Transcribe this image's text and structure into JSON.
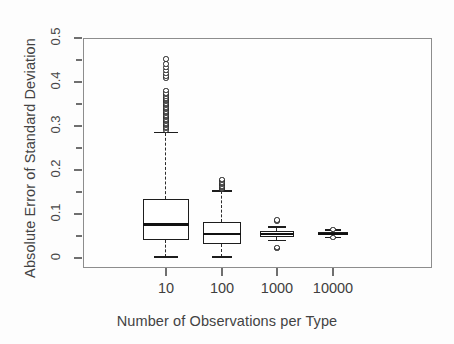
{
  "chart_data": {
    "type": "box",
    "title": "",
    "xlabel": "Number of Observations per Type",
    "ylabel": "Absolute Error of Standard Deviation",
    "categories": [
      "10",
      "100",
      "1000",
      "10000"
    ],
    "ylim": [
      0,
      0.5
    ],
    "yticks": [
      0,
      0.1,
      0.2,
      0.3,
      0.4,
      0.5
    ],
    "ytick_labels": [
      "0",
      "0.1",
      "0.2",
      "0.3",
      "0.4",
      "0.5"
    ],
    "yminor_ticks": [
      0.05,
      0.15,
      0.25,
      0.35,
      0.45
    ],
    "grid": false,
    "legend": false,
    "boxes": [
      {
        "category": "10",
        "whisker_low": 0.002,
        "q1": 0.04,
        "median": 0.076,
        "q3": 0.133,
        "whisker_high": 0.285,
        "outliers": [
          0.29,
          0.294,
          0.298,
          0.301,
          0.304,
          0.307,
          0.31,
          0.313,
          0.316,
          0.319,
          0.322,
          0.325,
          0.328,
          0.331,
          0.334,
          0.337,
          0.34,
          0.343,
          0.346,
          0.349,
          0.352,
          0.355,
          0.358,
          0.361,
          0.364,
          0.367,
          0.371,
          0.375,
          0.38,
          0.409,
          0.414,
          0.42,
          0.426,
          0.433,
          0.441,
          0.452
        ]
      },
      {
        "category": "100",
        "whisker_low": 0.002,
        "q1": 0.032,
        "median": 0.055,
        "q3": 0.082,
        "whisker_high": 0.152,
        "outliers": [
          0.155,
          0.158,
          0.161,
          0.164,
          0.167,
          0.17,
          0.173,
          0.176,
          0.179
        ]
      },
      {
        "category": "1000",
        "whisker_low": 0.04,
        "q1": 0.048,
        "median": 0.055,
        "q3": 0.062,
        "whisker_high": 0.07,
        "outliers": [
          0.084,
          0.086,
          0.022,
          0.024
        ]
      },
      {
        "category": "10000",
        "whisker_low": 0.047,
        "q1": 0.052,
        "median": 0.055,
        "q3": 0.058,
        "whisker_high": 0.063,
        "outliers": [
          0.065,
          0.046
        ]
      }
    ]
  }
}
